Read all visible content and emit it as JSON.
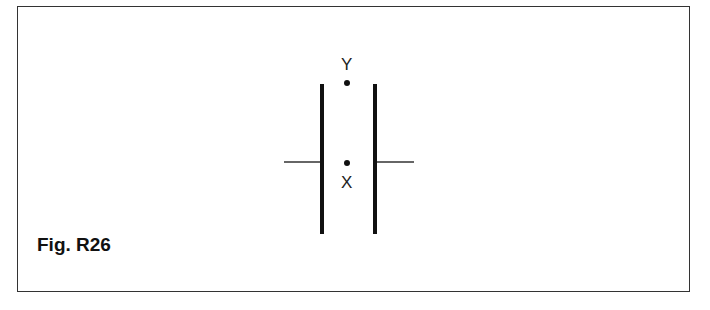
{
  "figure": {
    "label": "Fig. R26",
    "points": [
      {
        "name": "Y",
        "label": "Y"
      },
      {
        "name": "X",
        "label": "X"
      }
    ]
  },
  "colors": {
    "line": "#111111",
    "border": "#333333"
  }
}
